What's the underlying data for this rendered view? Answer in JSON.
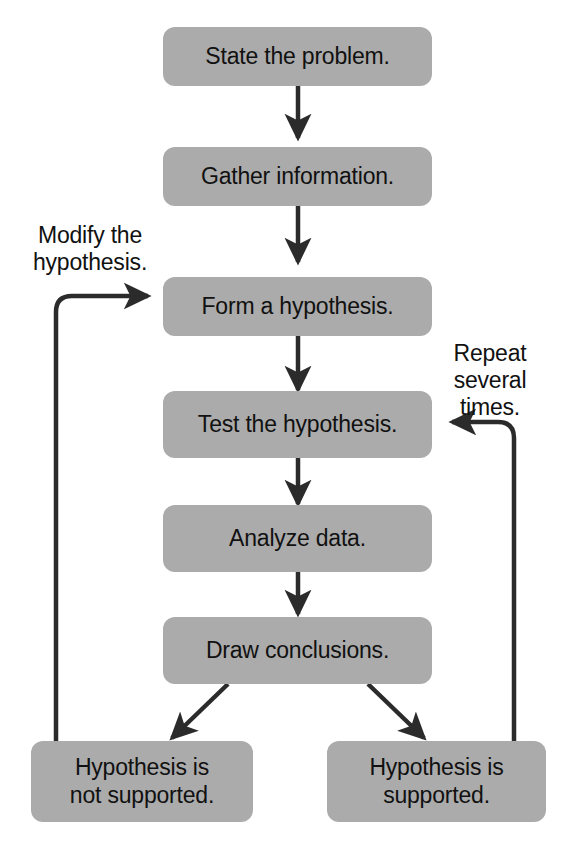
{
  "diagram": {
    "node_fill_color": "#ababab",
    "text_color": "#111111",
    "arrow_color": "#2b2b2b",
    "background_color": "#ffffff",
    "nodes": [
      {
        "id": "state-problem",
        "label": "State the problem."
      },
      {
        "id": "gather-info",
        "label": "Gather information."
      },
      {
        "id": "form-hypothesis",
        "label": "Form a hypothesis."
      },
      {
        "id": "test-hypothesis",
        "label": "Test the hypothesis."
      },
      {
        "id": "analyze-data",
        "label": "Analyze data."
      },
      {
        "id": "draw-conclusions",
        "label": "Draw conclusions."
      },
      {
        "id": "not-supported",
        "label": "Hypothesis is\nnot supported."
      },
      {
        "id": "supported",
        "label": "Hypothesis is\nsupported."
      }
    ],
    "edge_labels": {
      "modify": "Modify the\nhypothesis.",
      "repeat": "Repeat\nseveral\ntimes."
    },
    "edges": [
      {
        "from": "state-problem",
        "to": "gather-info",
        "kind": "straight-down"
      },
      {
        "from": "gather-info",
        "to": "form-hypothesis",
        "kind": "straight-down"
      },
      {
        "from": "form-hypothesis",
        "to": "test-hypothesis",
        "kind": "straight-down"
      },
      {
        "from": "test-hypothesis",
        "to": "analyze-data",
        "kind": "straight-down"
      },
      {
        "from": "analyze-data",
        "to": "draw-conclusions",
        "kind": "straight-down"
      },
      {
        "from": "draw-conclusions",
        "to": "not-supported",
        "kind": "diagonal-left"
      },
      {
        "from": "draw-conclusions",
        "to": "supported",
        "kind": "diagonal-right"
      },
      {
        "from": "not-supported",
        "to": "form-hypothesis",
        "kind": "loop-left",
        "label": "modify"
      },
      {
        "from": "supported",
        "to": "test-hypothesis",
        "kind": "loop-right",
        "label": "repeat"
      }
    ]
  }
}
